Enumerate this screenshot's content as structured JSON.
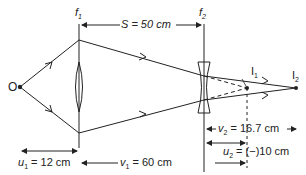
{
  "diagram": {
    "type": "two-lens optical system ray diagram",
    "object_label": "O",
    "lens1_label": "f",
    "lens1_sub": "1",
    "lens2_label": "f",
    "lens2_sub": "2",
    "image1_label": "I",
    "image1_sub": "1",
    "image2_label": "I",
    "image2_sub": "2",
    "separation": "S = 50 cm",
    "u1": "= 12 cm",
    "u1_sym": "u",
    "v1": "= 60 cm",
    "v1_sym": "v",
    "v2": "= 16.7 cm",
    "v2_sym": "v",
    "u2": "= (−)10 cm",
    "u2_sym": "u",
    "colors": {
      "line": "#222222",
      "background": "#ffffff"
    }
  }
}
